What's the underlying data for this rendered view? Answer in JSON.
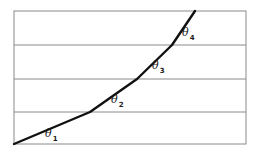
{
  "diagram": {
    "type": "piecewise-linear-curve",
    "frame": {
      "x": 14,
      "y": 11,
      "width": 232,
      "height": 133,
      "stroke": "#8a8a8a"
    },
    "horizontal_lines_y": [
      45,
      79,
      112
    ],
    "curve": {
      "stroke": "#111111",
      "points": [
        [
          14,
          144
        ],
        [
          90,
          112
        ],
        [
          137,
          79
        ],
        [
          172,
          45
        ],
        [
          195,
          11
        ]
      ]
    },
    "labels": [
      {
        "symbol": "θ",
        "subscript": "1",
        "x": 47,
        "y": 137
      },
      {
        "symbol": "θ",
        "subscript": "2",
        "x": 113,
        "y": 103
      },
      {
        "symbol": "θ",
        "subscript": "3",
        "x": 154,
        "y": 69
      },
      {
        "symbol": "θ",
        "subscript": "4",
        "x": 184,
        "y": 36
      }
    ]
  }
}
